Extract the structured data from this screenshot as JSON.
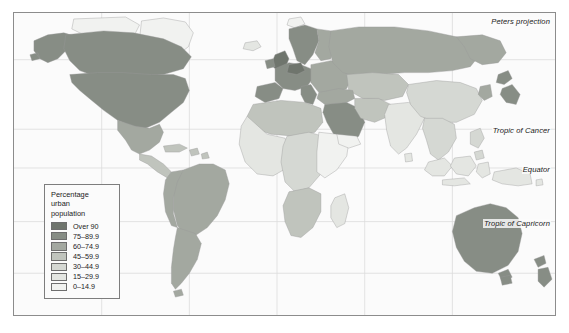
{
  "map": {
    "projection_note": "Peters projection",
    "graticule_labels": [
      {
        "id": "cancer",
        "text": "Tropic of Cancer"
      },
      {
        "id": "equator",
        "text": "Equator"
      },
      {
        "id": "capricorn",
        "text": "Tropic of Capricorn"
      }
    ],
    "background_color": "#fbfbfb",
    "border_color": "#8c8c8c",
    "graticule_color": "#d8d8d8",
    "coast_color": "#9a9a9a"
  },
  "legend": {
    "title": "Percentage\nurban\npopulation",
    "classes": [
      {
        "label": "Over 90",
        "color": "#6f756d"
      },
      {
        "label": "75–89.9",
        "color": "#878d85"
      },
      {
        "label": "60–74.9",
        "color": "#a3a8a0"
      },
      {
        "label": "45–59.9",
        "color": "#c0c4bd"
      },
      {
        "label": "30–44.9",
        "color": "#d5d8d3"
      },
      {
        "label": "15–29.9",
        "color": "#e4e6e2"
      },
      {
        "label": "0–14.9",
        "color": "#f1f2f0"
      }
    ]
  },
  "chart_data": {
    "type": "choropleth-map",
    "title": "Percentage urban population",
    "projection": "Peters projection",
    "legend_position": "lower-left",
    "categories": [
      "Over 90",
      "75–89.9",
      "60–74.9",
      "45–59.9",
      "30–44.9",
      "15–29.9",
      "0–14.9"
    ],
    "class_colors": [
      "#6f756d",
      "#878d85",
      "#a3a8a0",
      "#c0c4bd",
      "#d5d8d3",
      "#e4e6e2",
      "#f1f2f0"
    ],
    "regions": [
      {
        "name": "Canada",
        "class": "75–89.9"
      },
      {
        "name": "United States",
        "class": "75–89.9"
      },
      {
        "name": "Alaska",
        "class": "75–89.9"
      },
      {
        "name": "Greenland",
        "class": "0–14.9"
      },
      {
        "name": "Mexico",
        "class": "60–74.9"
      },
      {
        "name": "Central America",
        "class": "45–59.9"
      },
      {
        "name": "Caribbean",
        "class": "45–59.9"
      },
      {
        "name": "Brazil",
        "class": "60–74.9"
      },
      {
        "name": "Argentina",
        "class": "75–89.9"
      },
      {
        "name": "Andean South America",
        "class": "60–74.9"
      },
      {
        "name": "United Kingdom",
        "class": "Over 90"
      },
      {
        "name": "Belgium and Netherlands",
        "class": "Over 90"
      },
      {
        "name": "Scandinavia",
        "class": "75–89.9"
      },
      {
        "name": "Western Europe",
        "class": "75–89.9"
      },
      {
        "name": "Eastern Europe",
        "class": "60–74.9"
      },
      {
        "name": "Russia",
        "class": "60–74.9"
      },
      {
        "name": "Central Asia",
        "class": "45–59.9"
      },
      {
        "name": "North Africa",
        "class": "45–59.9"
      },
      {
        "name": "West Africa",
        "class": "15–29.9"
      },
      {
        "name": "Central Africa",
        "class": "30–44.9"
      },
      {
        "name": "East Africa",
        "class": "0–14.9"
      },
      {
        "name": "Southern Africa",
        "class": "45–59.9"
      },
      {
        "name": "Arabian Peninsula",
        "class": "75–89.9"
      },
      {
        "name": "India",
        "class": "15–29.9"
      },
      {
        "name": "China",
        "class": "30–44.9"
      },
      {
        "name": "Southeast Asia",
        "class": "30–44.9"
      },
      {
        "name": "Japan",
        "class": "75–89.9"
      },
      {
        "name": "Australia",
        "class": "75–89.9"
      },
      {
        "name": "New Zealand",
        "class": "75–89.9"
      }
    ]
  }
}
